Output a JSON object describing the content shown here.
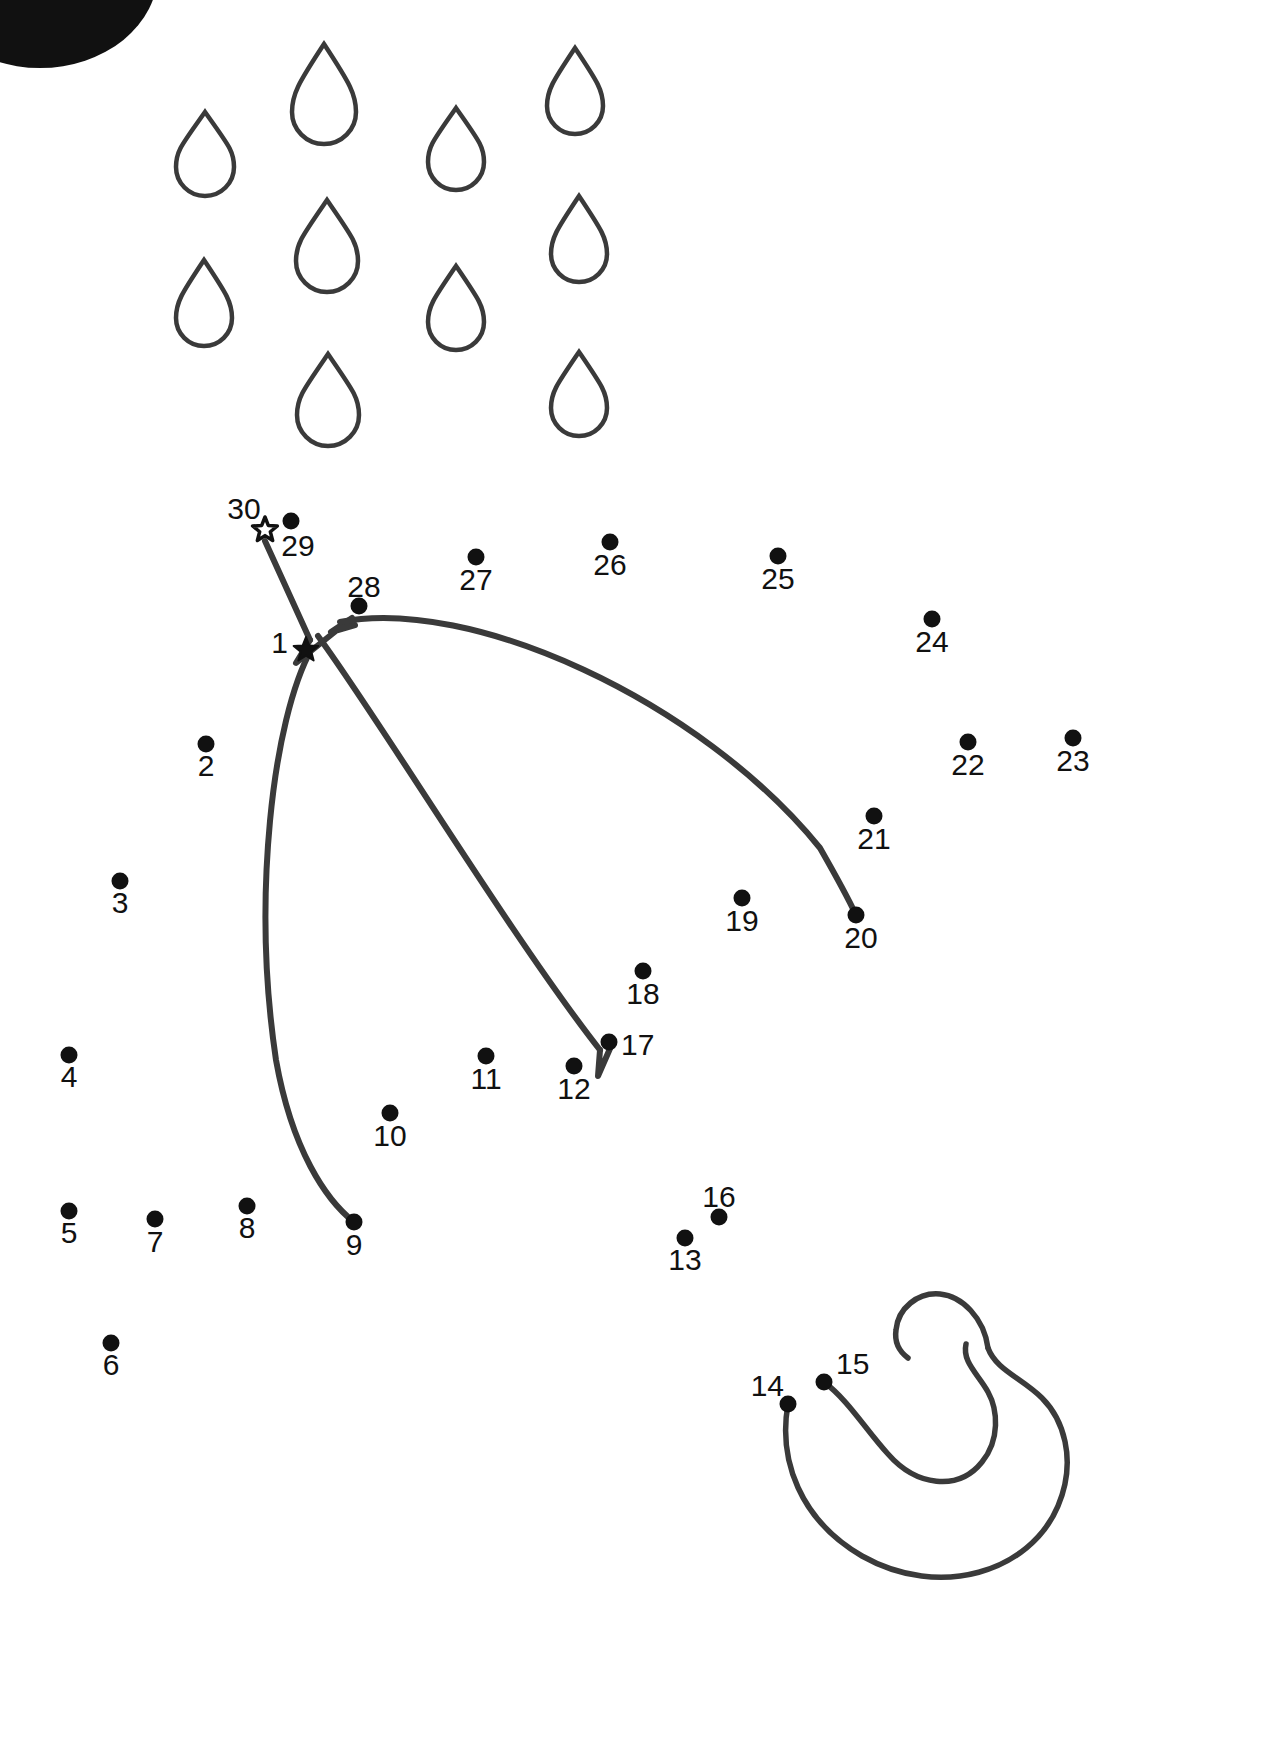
{
  "page": {
    "width": 1277,
    "height": 1758,
    "background_color": "#ffffff",
    "ink_color": "#111111",
    "line_color": "#3a3a3a"
  },
  "puzzle": {
    "type": "dot-to-dot",
    "total_dots": 30,
    "start_marker": "filled-star",
    "end_marker": "open-star",
    "subject": "umbrella"
  },
  "cloud": {
    "name": "cloud-blob",
    "color": "#111111",
    "cx": 40,
    "cy": -28,
    "rx": 118,
    "ry": 96
  },
  "raindrops": [
    {
      "id": "drop-1",
      "x": 176,
      "y": 112,
      "w": 58,
      "h": 84
    },
    {
      "id": "drop-2",
      "x": 292,
      "y": 44,
      "w": 64,
      "h": 100
    },
    {
      "id": "drop-3",
      "x": 428,
      "y": 108,
      "w": 56,
      "h": 82
    },
    {
      "id": "drop-4",
      "x": 547,
      "y": 48,
      "w": 56,
      "h": 86
    },
    {
      "id": "drop-5",
      "x": 296,
      "y": 200,
      "w": 62,
      "h": 92
    },
    {
      "id": "drop-6",
      "x": 551,
      "y": 196,
      "w": 56,
      "h": 86
    },
    {
      "id": "drop-7",
      "x": 176,
      "y": 260,
      "w": 56,
      "h": 86
    },
    {
      "id": "drop-8",
      "x": 428,
      "y": 266,
      "w": 56,
      "h": 84
    },
    {
      "id": "drop-9",
      "x": 297,
      "y": 354,
      "w": 62,
      "h": 92
    },
    {
      "id": "drop-10",
      "x": 551,
      "y": 352,
      "w": 56,
      "h": 84
    }
  ],
  "dots": [
    {
      "n": "1",
      "x": 306,
      "y": 650,
      "lx": 288,
      "ly": 653,
      "marker": "filled-star",
      "label_anchor": "end"
    },
    {
      "n": "2",
      "x": 206,
      "y": 744,
      "lx": 206,
      "ly": 776,
      "marker": "circle",
      "label_anchor": "middle"
    },
    {
      "n": "3",
      "x": 120,
      "y": 881,
      "lx": 120,
      "ly": 913,
      "marker": "circle",
      "label_anchor": "middle"
    },
    {
      "n": "4",
      "x": 69,
      "y": 1055,
      "lx": 69,
      "ly": 1087,
      "marker": "circle",
      "label_anchor": "middle"
    },
    {
      "n": "5",
      "x": 69,
      "y": 1211,
      "lx": 69,
      "ly": 1243,
      "marker": "circle",
      "label_anchor": "middle"
    },
    {
      "n": "6",
      "x": 111,
      "y": 1343,
      "lx": 111,
      "ly": 1375,
      "marker": "circle",
      "label_anchor": "middle"
    },
    {
      "n": "7",
      "x": 155,
      "y": 1219,
      "lx": 155,
      "ly": 1252,
      "marker": "circle",
      "label_anchor": "middle"
    },
    {
      "n": "8",
      "x": 247,
      "y": 1206,
      "lx": 247,
      "ly": 1238,
      "marker": "circle",
      "label_anchor": "middle"
    },
    {
      "n": "9",
      "x": 354,
      "y": 1222,
      "lx": 354,
      "ly": 1255,
      "marker": "circle",
      "label_anchor": "middle"
    },
    {
      "n": "10",
      "x": 390,
      "y": 1113,
      "lx": 390,
      "ly": 1146,
      "marker": "circle",
      "label_anchor": "middle"
    },
    {
      "n": "11",
      "x": 486,
      "y": 1056,
      "lx": 486,
      "ly": 1089,
      "marker": "circle",
      "label_anchor": "middle"
    },
    {
      "n": "12",
      "x": 574,
      "y": 1066,
      "lx": 574,
      "ly": 1099,
      "marker": "circle",
      "label_anchor": "middle"
    },
    {
      "n": "13",
      "x": 685,
      "y": 1238,
      "lx": 685,
      "ly": 1270,
      "marker": "circle",
      "label_anchor": "middle"
    },
    {
      "n": "14",
      "x": 788,
      "y": 1404,
      "lx": 784,
      "ly": 1396,
      "marker": "circle",
      "label_anchor": "end"
    },
    {
      "n": "15",
      "x": 824,
      "y": 1382,
      "lx": 836,
      "ly": 1374,
      "marker": "circle",
      "label_anchor": "start"
    },
    {
      "n": "16",
      "x": 719,
      "y": 1217,
      "lx": 719,
      "ly": 1207,
      "marker": "circle",
      "label_anchor": "middle"
    },
    {
      "n": "17",
      "x": 609,
      "y": 1042,
      "lx": 621,
      "ly": 1055,
      "marker": "circle",
      "label_anchor": "start"
    },
    {
      "n": "18",
      "x": 643,
      "y": 971,
      "lx": 643,
      "ly": 1004,
      "marker": "circle",
      "label_anchor": "middle"
    },
    {
      "n": "19",
      "x": 742,
      "y": 898,
      "lx": 742,
      "ly": 931,
      "marker": "circle",
      "label_anchor": "middle"
    },
    {
      "n": "20",
      "x": 856,
      "y": 915,
      "lx": 861,
      "ly": 948,
      "marker": "circle",
      "label_anchor": "middle"
    },
    {
      "n": "21",
      "x": 874,
      "y": 816,
      "lx": 874,
      "ly": 849,
      "marker": "circle",
      "label_anchor": "middle"
    },
    {
      "n": "22",
      "x": 968,
      "y": 742,
      "lx": 968,
      "ly": 775,
      "marker": "circle",
      "label_anchor": "middle"
    },
    {
      "n": "23",
      "x": 1073,
      "y": 738,
      "lx": 1073,
      "ly": 771,
      "marker": "circle",
      "label_anchor": "middle"
    },
    {
      "n": "24",
      "x": 932,
      "y": 619,
      "lx": 932,
      "ly": 652,
      "marker": "circle",
      "label_anchor": "middle"
    },
    {
      "n": "25",
      "x": 778,
      "y": 556,
      "lx": 778,
      "ly": 589,
      "marker": "circle",
      "label_anchor": "middle"
    },
    {
      "n": "26",
      "x": 610,
      "y": 542,
      "lx": 610,
      "ly": 575,
      "marker": "circle",
      "label_anchor": "middle"
    },
    {
      "n": "27",
      "x": 476,
      "y": 557,
      "lx": 476,
      "ly": 590,
      "marker": "circle",
      "label_anchor": "middle"
    },
    {
      "n": "28",
      "x": 359,
      "y": 606,
      "lx": 364,
      "ly": 597,
      "marker": "circle",
      "label_anchor": "middle"
    },
    {
      "n": "29",
      "x": 291,
      "y": 521,
      "lx": 298,
      "ly": 556,
      "marker": "circle",
      "label_anchor": "middle"
    },
    {
      "n": "30",
      "x": 265,
      "y": 530,
      "lx": 244,
      "ly": 519,
      "marker": "open-star",
      "label_anchor": "middle"
    }
  ],
  "drawn_strokes": [
    {
      "id": "stroke-handle-stem",
      "d": "M 265 541 L 310 640"
    },
    {
      "id": "stroke-tip-zigzag",
      "d": "M 310 640 L 296 663 L 352 618 L 331 632 L 355 625"
    },
    {
      "id": "stroke-canopy-right",
      "d": "M 340 622 C 470 596 700 700 820 848 C 836 876 848 898 856 915"
    },
    {
      "id": "stroke-rib-center",
      "d": "M 318 636 C 380 720 510 935 600 1050"
    },
    {
      "id": "stroke-rib-tip-v",
      "d": "M 600 1050 L 598 1076 L 612 1044"
    },
    {
      "id": "stroke-canopy-left",
      "d": "M 312 648 C 272 720 252 900 276 1060 C 292 1150 326 1200 354 1222"
    }
  ],
  "handle_hook": {
    "outer_d": "M 788 1404 C 778 1460 800 1520 862 1556 C 940 1600 1030 1572 1058 1506 C 1078 1458 1062 1418 1042 1398 C 1022 1378 996 1370 988 1348",
    "inner_d": "M 824 1382 C 848 1400 866 1430 888 1454 C 916 1486 958 1492 982 1462 C 1000 1440 998 1410 988 1392 C 978 1374 962 1362 966 1344",
    "cap_d": "M 988 1348 C 984 1318 962 1296 940 1294 C 918 1292 898 1308 896 1330 C 894 1344 900 1352 908 1358"
  }
}
